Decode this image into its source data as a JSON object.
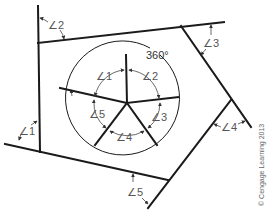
{
  "diagram": {
    "center_label": "360°",
    "central_angles": [
      {
        "id": "c1",
        "label": "∠1"
      },
      {
        "id": "c2",
        "label": "∠2"
      },
      {
        "id": "c3",
        "label": "∠3"
      },
      {
        "id": "c4",
        "label": "∠4"
      },
      {
        "id": "c5",
        "label": "∠5"
      }
    ],
    "exterior_angles": [
      {
        "id": "e1",
        "label": "∠1"
      },
      {
        "id": "e2",
        "label": "∠2"
      },
      {
        "id": "e3",
        "label": "∠3"
      },
      {
        "id": "e4",
        "label": "∠4"
      },
      {
        "id": "e5",
        "label": "∠5"
      }
    ],
    "copyright": "© Cengage Learning 2013",
    "colors": {
      "line": "#1a1a1a",
      "label": "#555555",
      "background": "#ffffff"
    }
  }
}
